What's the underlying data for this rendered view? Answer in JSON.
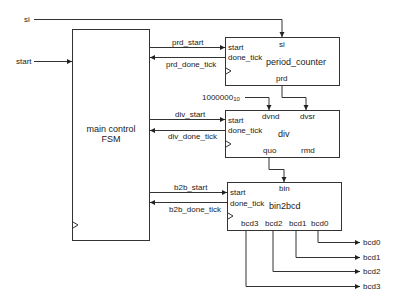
{
  "diagram": {
    "type": "block-diagram",
    "inputs": {
      "si": "si",
      "start": "start"
    },
    "fsm": {
      "line1": "main control",
      "line2": "FSM"
    },
    "period_counter": {
      "name": "period_counter",
      "ports": {
        "start": "start",
        "done_tick": "done_tick",
        "si": "si",
        "prd": "prd"
      }
    },
    "div": {
      "name": "div",
      "constant": "1000000",
      "constant_base": "10",
      "ports": {
        "start": "start",
        "done_tick": "done_tick",
        "dvnd": "dvnd",
        "dvsr": "dvsr",
        "quo": "quo",
        "rmd": "rmd"
      }
    },
    "bin2bcd": {
      "name": "bin2bcd",
      "ports": {
        "start": "start",
        "done_tick": "done_tick",
        "bin": "bin",
        "bcd3": "bcd3",
        "bcd2": "bcd2",
        "bcd1": "bcd1",
        "bcd0": "bcd0"
      }
    },
    "signals": {
      "prd_start": "prd_start",
      "prd_done_tick": "prd_done_tick",
      "div_start": "div_start",
      "div_done_tick": "div_done_tick",
      "b2b_start": "b2b_start",
      "b2b_done_tick": "b2b_done_tick"
    },
    "outputs": [
      "bcd0",
      "bcd1",
      "bcd2",
      "bcd3"
    ]
  }
}
